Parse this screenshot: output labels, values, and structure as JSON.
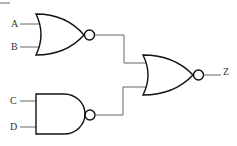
{
  "diagram": {
    "type": "logic-circuit",
    "inputs": [
      {
        "label": "A",
        "to": "gate1"
      },
      {
        "label": "B",
        "to": "gate1"
      },
      {
        "label": "C",
        "to": "gate2"
      },
      {
        "label": "D",
        "to": "gate2"
      }
    ],
    "gates": [
      {
        "id": "gate1",
        "kind": "NOR",
        "inputs": [
          "A",
          "B"
        ]
      },
      {
        "id": "gate2",
        "kind": "NAND",
        "inputs": [
          "C",
          "D"
        ]
      },
      {
        "id": "gate3",
        "kind": "NOR",
        "inputs": [
          "gate1",
          "gate2"
        ],
        "output": "Z"
      }
    ],
    "output": {
      "label": "Z"
    }
  },
  "labels": {
    "a": "A",
    "b": "B",
    "c": "C",
    "d": "D",
    "z": "Z"
  }
}
